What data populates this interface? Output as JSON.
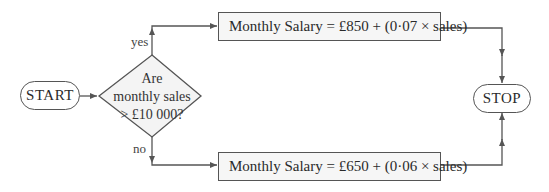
{
  "flowchart": {
    "start": {
      "label": "START"
    },
    "decision": {
      "line1": "Are",
      "line2": "monthly sales",
      "line3": "> £10 000?"
    },
    "branch_yes": {
      "label": "yes"
    },
    "branch_no": {
      "label": "no"
    },
    "process_yes": {
      "label": "Monthly Salary = £850 + (0·07 × sales)"
    },
    "process_no": {
      "label": "Monthly Salary = £650 + (0·06 × sales)"
    },
    "stop": {
      "label": "STOP"
    },
    "colors": {
      "stroke": "#555555",
      "box_fill": "#f6f6f6",
      "diamond_fill": "#f4f4f4",
      "text": "#2a2a2a"
    }
  }
}
